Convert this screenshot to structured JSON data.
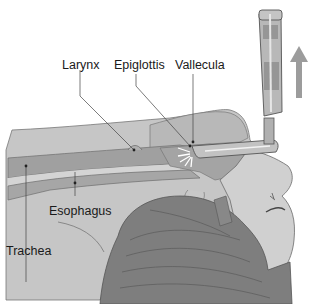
{
  "diagram": {
    "labels": {
      "larynx": "Larynx",
      "epiglottis": "Epiglottis",
      "vallecula": "Vallecula",
      "esophagus": "Esophagus",
      "trachea": "Trachea"
    },
    "arrow_direction": "up",
    "colors": {
      "tissue_light": "#c4c4c4",
      "tissue_mid": "#a9a9a9",
      "airway": "#9a9a9a",
      "face": "#cfcfcf",
      "hair": "#7d7d7d",
      "hair_line": "#5a5a5a",
      "instrument": "#b5b5b5",
      "arrow": "#9c9c9c",
      "outline": "#555555",
      "text": "#1a1a1a"
    }
  }
}
